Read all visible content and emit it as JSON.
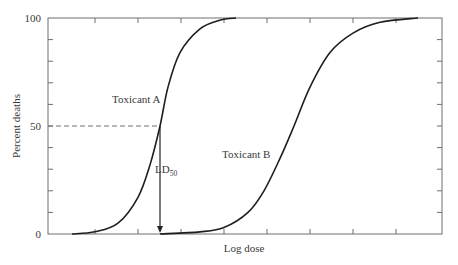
{
  "chart_data": {
    "type": "line",
    "title": "",
    "xlabel": "Log dose",
    "ylabel": "Percent deaths",
    "ylim": [
      0,
      100
    ],
    "yticks_labeled": [
      "0",
      "50",
      "100"
    ],
    "ytick_step": 10,
    "xtick_count": 8,
    "grid": false,
    "legend": null,
    "series": [
      {
        "name": "Toxicant A",
        "x_pixel_50": 160,
        "points": [
          [
            72,
            0
          ],
          [
            95,
            1
          ],
          [
            118,
            5
          ],
          [
            138,
            17
          ],
          [
            150,
            32
          ],
          [
            160,
            50
          ],
          [
            168,
            68
          ],
          [
            180,
            84
          ],
          [
            200,
            95
          ],
          [
            220,
            99
          ],
          [
            236,
            100
          ]
        ]
      },
      {
        "name": "Toxicant B",
        "x_pixel_50": 294,
        "points": [
          [
            160,
            0
          ],
          [
            200,
            1
          ],
          [
            224,
            3
          ],
          [
            248,
            10
          ],
          [
            264,
            20
          ],
          [
            280,
            35
          ],
          [
            294,
            50
          ],
          [
            310,
            68
          ],
          [
            330,
            84
          ],
          [
            353,
            93
          ],
          [
            380,
            98
          ],
          [
            418,
            100
          ]
        ]
      }
    ],
    "annotations": [
      {
        "text": "Toxicant A",
        "near_series": "Toxicant A"
      },
      {
        "text": "Toxicant B",
        "near_series": "Toxicant B"
      },
      {
        "text": "LD",
        "subscript": "50",
        "description": "vertical arrow from Toxicant A at 50% down to x-axis; dashed line from y-axis at 50"
      }
    ]
  },
  "labels": {
    "y_axis_title": "Percent deaths",
    "x_axis_title": "Log dose",
    "y_tick_0": "0",
    "y_tick_50": "50",
    "y_tick_100": "100",
    "series_a_label": "Toxicant A",
    "series_b_label": "Toxicant B",
    "ld_main": "LD",
    "ld_sub": "50"
  }
}
